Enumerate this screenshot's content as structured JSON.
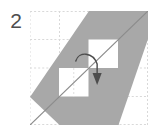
{
  "figure": {
    "step_label": "2",
    "caption": "Origami fold diagram step 2: grid with shaded parallelogram, two white square holes, a diagonal crease line and a curved downward fold arrow.",
    "canvas": {
      "width": 153,
      "height": 133,
      "background": "#ffffff"
    },
    "colors": {
      "shaded_region": "#a8a8a8",
      "grid_line": "#d9d9d9",
      "crease_line": "#8c8c8c",
      "hole_fill": "#ffffff",
      "arrow": "#4d4d4d",
      "step_number": "#4d4d4d"
    },
    "grid": {
      "origin_x": 30,
      "origin_y": 11,
      "columns": 4,
      "rows": 4,
      "cell_width": 29,
      "cell_height": 28.5,
      "line_style": "dashed",
      "x_ticks": [
        0,
        29,
        58,
        87,
        116
      ],
      "y_ticks": [
        0,
        28.5,
        57,
        85.5,
        114
      ]
    },
    "shapes": [
      {
        "name": "shaded-parallelogram",
        "type": "polygon",
        "points": "29,114 0,86 58,0 116,0 116,28 87,114",
        "fill": "#a8a8a8"
      },
      {
        "name": "hole-upper-right",
        "type": "rect",
        "x": 57,
        "y": 28,
        "width": 29,
        "height": 29,
        "fill": "#ffffff"
      },
      {
        "name": "hole-lower-left",
        "type": "rect",
        "x": 28,
        "y": 57,
        "width": 29,
        "height": 29,
        "fill": "#ffffff"
      }
    ],
    "crease_line": {
      "name": "diagonal-crease",
      "x1": 0,
      "y1": 114,
      "x2": 116,
      "y2": 0,
      "stroke": "#8c8c8c",
      "width": 1
    },
    "arrow": {
      "name": "fold-arrow",
      "direction": "down",
      "style": "curved",
      "path": "M 47,49 C 50,40 62,40 66,52 L 66,66",
      "head_points": "61,62 71,62 66,74",
      "stroke": "#4d4d4d"
    }
  }
}
